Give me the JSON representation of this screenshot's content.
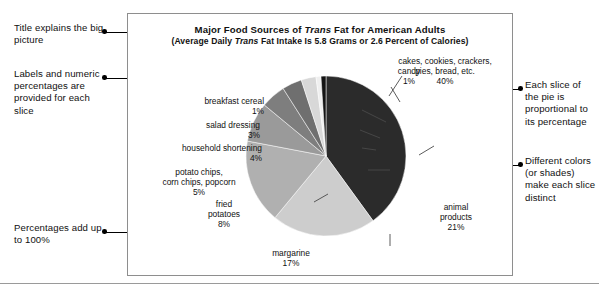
{
  "figure": {
    "title_prefix": "Major Food Sources of ",
    "title_italic": "Trans",
    "title_suffix": " Fat for American Adults",
    "subtitle_prefix": "(Average Daily ",
    "subtitle_italic": "Trans",
    "subtitle_suffix": " Fat Intake Is 5.8 Grams or 2.6 Percent of Calories)"
  },
  "annotations": {
    "left": [
      {
        "id": "title-explains",
        "text": "Title explains the big picture"
      },
      {
        "id": "labels-and-percentages",
        "text": "Labels and numeric percentages are provided for each slice"
      },
      {
        "id": "percentages-add-up",
        "text": "Percentages add up to 100%"
      }
    ],
    "right": [
      {
        "id": "slice-proportional",
        "text": "Each slice of the pie is proportional to its percentage"
      },
      {
        "id": "colors-distinct",
        "text": "Different colors (or shades) make each slice distinct"
      }
    ]
  },
  "chart_data": {
    "type": "pie",
    "title": "Major Food Sources of Trans Fat for American Adults",
    "subtitle": "(Average Daily Trans Fat Intake Is 5.8 Grams or 2.6 Percent of Calories)",
    "unit": "percent",
    "total": 100,
    "legend": "none",
    "categories": [
      "cakes, cookies, crackers, pies, bread, etc.",
      "animal products",
      "margarine",
      "fried potatoes",
      "potato chips, corn chips, popcorn",
      "household shortening",
      "salad dressing",
      "breakfast cereal",
      "candy"
    ],
    "values": [
      40,
      21,
      17,
      8,
      5,
      4,
      3,
      1,
      1
    ],
    "colors": [
      "#2b2b2b",
      "#cdcdcd",
      "#b0b0b0",
      "#9a9a9a",
      "#7e7e7e",
      "#6f6f6f",
      "#d8d8d8",
      "#efefef",
      "#141414"
    ],
    "slices": [
      {
        "name": "cakes, cookies, crackers, pies, bread, etc.",
        "value": 40,
        "label_line1": "cakes, cookies, crackers,",
        "label_line2": "pies, bread, etc.",
        "label_line3": "40%",
        "color": "#2b2b2b"
      },
      {
        "name": "animal products",
        "value": 21,
        "label_line1": "animal",
        "label_line2": "products",
        "label_line3": "21%",
        "color": "#cdcdcd"
      },
      {
        "name": "margarine",
        "value": 17,
        "label_line1": "margarine",
        "label_line2": "17%",
        "label_line3": "",
        "color": "#b0b0b0"
      },
      {
        "name": "fried potatoes",
        "value": 8,
        "label_line1": "fried",
        "label_line2": "potatoes",
        "label_line3": "8%",
        "color": "#9a9a9a"
      },
      {
        "name": "potato chips, corn chips, popcorn",
        "value": 5,
        "label_line1": "potato chips,",
        "label_line2": "corn chips, popcorn",
        "label_line3": "5%",
        "color": "#7e7e7e"
      },
      {
        "name": "household shortening",
        "value": 4,
        "label_line1": "household shortening",
        "label_line2": "4%",
        "label_line3": "",
        "color": "#6f6f6f"
      },
      {
        "name": "salad dressing",
        "value": 3,
        "label_line1": "salad dressing",
        "label_line2": "3%",
        "label_line3": "",
        "color": "#d8d8d8"
      },
      {
        "name": "breakfast cereal",
        "value": 1,
        "label_line1": "breakfast cereal",
        "label_line2": "1%",
        "label_line3": "",
        "color": "#efefef"
      },
      {
        "name": "candy",
        "value": 1,
        "label_line1": "candy",
        "label_line2": "1%",
        "label_line3": "",
        "color": "#141414"
      }
    ]
  },
  "labels": {
    "cakes": "cakes, cookies, crackers,\npies, bread, etc.\n40%",
    "animal": "animal\nproducts\n21%",
    "margarine": "margarine\n17%",
    "fried_potatoes": "fried\npotatoes\n8%",
    "potato_chips": "potato chips,\ncorn chips, popcorn\n5%",
    "household_shortening": "household shortening\n4%",
    "salad_dressing": "salad dressing\n3%",
    "breakfast_cereal": "breakfast cereal\n1%",
    "candy": "candy\n1%"
  }
}
